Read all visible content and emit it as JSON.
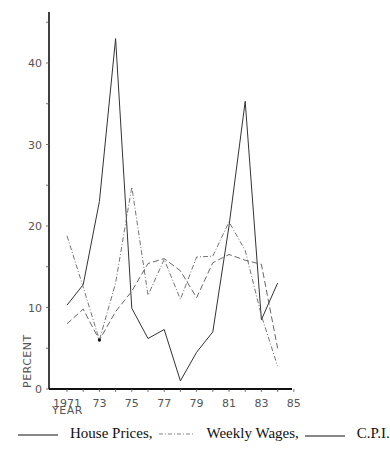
{
  "chart_data": {
    "type": "line",
    "title": "",
    "xlabel": "YEAR",
    "ylabel": "PERCENT",
    "x": [
      1971,
      1972,
      1973,
      1974,
      1975,
      1976,
      1977,
      1978,
      1979,
      1980,
      1981,
      1982,
      1983,
      1984
    ],
    "x_tick_labels": [
      "1971",
      "73",
      "75",
      "77",
      "79",
      "81",
      "83",
      "85"
    ],
    "x_tick_values": [
      1971,
      1973,
      1975,
      1977,
      1979,
      1981,
      1983,
      1985
    ],
    "y_tick_labels": [
      "0",
      "10",
      "20",
      "30",
      "40"
    ],
    "y_tick_values": [
      0,
      10,
      20,
      30,
      40
    ],
    "xlim": [
      1970,
      1985
    ],
    "ylim": [
      0,
      47
    ],
    "grid": false,
    "legend_position": "bottom",
    "series": [
      {
        "name": "House Prices",
        "style": "solid",
        "values": [
          10.3,
          12.8,
          23.0,
          43.0,
          9.9,
          6.2,
          7.3,
          1.0,
          4.5,
          7.0,
          20.0,
          35.3,
          8.5,
          13.0
        ]
      },
      {
        "name": "Weekly Wages",
        "style": "dash-dot",
        "values": [
          18.8,
          12.5,
          6.0,
          13.0,
          24.8,
          11.5,
          15.9,
          11.0,
          16.2,
          16.3,
          20.5,
          17.0,
          9.0,
          2.8
        ]
      },
      {
        "name": "C.P.I.",
        "style": "dashed",
        "values": [
          8.0,
          9.8,
          6.0,
          9.5,
          12.0,
          15.4,
          16.0,
          14.5,
          11.2,
          15.5,
          16.5,
          15.8,
          15.3,
          5.0
        ]
      }
    ]
  },
  "legend": {
    "house_prices": "House Prices,",
    "weekly_wages": "Weekly Wages,",
    "cpi": "C.P.I."
  },
  "axis": {
    "xlabel": "YEAR",
    "ylabel": "PERCENT"
  }
}
